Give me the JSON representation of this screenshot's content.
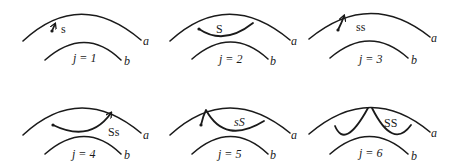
{
  "figure": {
    "panels": [
      {
        "id": "p1",
        "j_label": "j = 1",
        "j_value": 1,
        "trajectory_label": "s",
        "arc_outer_label": "a",
        "arc_inner_label": "b"
      },
      {
        "id": "p2",
        "j_label": "j = 2",
        "j_value": 2,
        "trajectory_label": "S",
        "arc_outer_label": "a",
        "arc_inner_label": "b"
      },
      {
        "id": "p3",
        "j_label": "j = 3",
        "j_value": 3,
        "trajectory_label": "ss",
        "arc_outer_label": "a",
        "arc_inner_label": "b"
      },
      {
        "id": "p4",
        "j_label": "j = 4",
        "j_value": 4,
        "trajectory_label": "Ss",
        "arc_outer_label": "a",
        "arc_inner_label": "b"
      },
      {
        "id": "p5",
        "j_label": "j = 5",
        "j_value": 5,
        "trajectory_label": "sS",
        "arc_outer_label": "a",
        "arc_inner_label": "b"
      },
      {
        "id": "p6",
        "j_label": "j = 6",
        "j_value": 6,
        "trajectory_label": "SS",
        "arc_outer_label": "a",
        "arc_inner_label": "b"
      }
    ],
    "colors": {
      "stroke": "#1a1a1a",
      "background": "#ffffff"
    }
  }
}
